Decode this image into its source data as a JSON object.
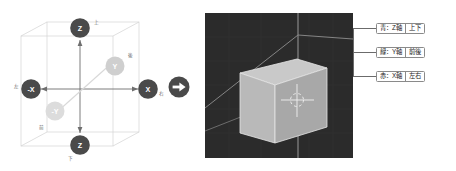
{
  "diagram": {
    "title_hidden": "",
    "wireframe_box": {
      "label": "bounding-box"
    },
    "nodes": [
      {
        "id": "z-up",
        "label": "Z",
        "dir_label": "上",
        "color": "#4a4a4a",
        "faded": false
      },
      {
        "id": "z-down",
        "label": "Z",
        "dir_label": "下",
        "color": "#4a4a4a",
        "faded": false
      },
      {
        "id": "x-right",
        "label": "X",
        "dir_label": "右",
        "color": "#4a4a4a",
        "faded": false
      },
      {
        "id": "x-left",
        "label": "-X",
        "dir_label": "左",
        "color": "#4a4a4a",
        "faded": false
      },
      {
        "id": "y-back",
        "label": "Y",
        "dir_label": "後",
        "color": "#cfcfcf",
        "faded": true
      },
      {
        "id": "y-front",
        "label": "-Y",
        "dir_label": "前",
        "color": "#dcdcdc",
        "faded": true
      }
    ]
  },
  "flow": {
    "arrow_glyph": "→",
    "arrow_name": "right-arrow"
  },
  "viewport": {
    "background": "#2b2b2b",
    "grid_color": "#8e8e8e",
    "object_name": "cube",
    "cube_face_color": "#b9b9b9",
    "cube_top_color": "#c9c9c9",
    "cube_side_color": "#9d9d9d",
    "cursor_name": "3d-cursor"
  },
  "callouts": [
    {
      "id": "callout-z",
      "axis_text": "青：Z軸",
      "dir_text": "上下",
      "color": "#2255cc"
    },
    {
      "id": "callout-y",
      "axis_text": "緑：Y軸",
      "dir_text": "前後",
      "color": "#22aa55"
    },
    {
      "id": "callout-x",
      "axis_text": "赤：X軸",
      "dir_text": "左右",
      "color": "#cc3333"
    }
  ]
}
